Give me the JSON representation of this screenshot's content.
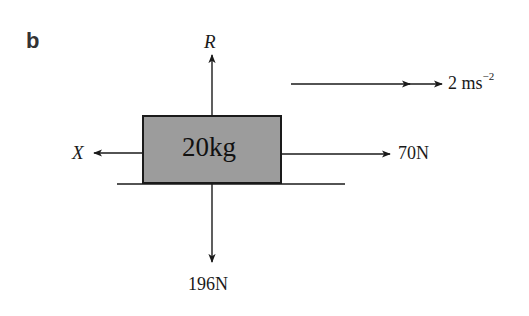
{
  "diagram": {
    "part_label": "b",
    "block": {
      "mass_label": "20kg",
      "fill": "#9c9c9c",
      "border": "#1a1a1a"
    },
    "forces": {
      "reaction": {
        "label": "R",
        "direction": "up"
      },
      "friction": {
        "label": "X",
        "direction": "left"
      },
      "applied": {
        "label": "70N",
        "direction": "right"
      },
      "weight": {
        "label": "196N",
        "direction": "down"
      }
    },
    "acceleration": {
      "value": "2 ms",
      "exponent": "−2",
      "direction": "right"
    }
  }
}
